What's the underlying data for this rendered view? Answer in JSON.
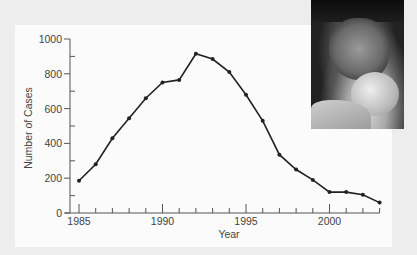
{
  "chart_data": {
    "type": "line",
    "title": "",
    "xlabel": "Year",
    "ylabel": "Number of Cases",
    "x": [
      1985,
      1986,
      1987,
      1988,
      1989,
      1990,
      1991,
      1992,
      1993,
      1994,
      1995,
      1996,
      1997,
      1998,
      1999,
      2000,
      2001,
      2002,
      2003
    ],
    "series": [
      {
        "name": "Cases",
        "values": [
          185,
          280,
          430,
          545,
          660,
          750,
          765,
          915,
          885,
          810,
          680,
          530,
          335,
          250,
          190,
          120,
          120,
          105,
          60
        ]
      }
    ],
    "x_ticks": [
      1985,
      1990,
      1995,
      2000
    ],
    "y_ticks": [
      0,
      200,
      400,
      600,
      800,
      1000
    ],
    "xlim": [
      1985,
      2003
    ],
    "ylim": [
      0,
      1000
    ],
    "grid": false,
    "legend": "none",
    "line_color": "#222222",
    "marker": "filled-circle"
  },
  "photo": {
    "description": "black-and-white photo of adult kissing infant"
  }
}
